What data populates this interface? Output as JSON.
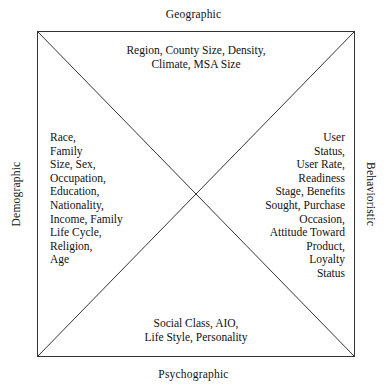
{
  "diagram": {
    "type": "four-quadrant-square-with-diagonals",
    "colors": {
      "background": "#ffffff",
      "line": "#333333",
      "text": "#111111"
    },
    "axes": {
      "top_label": "Geographic",
      "bottom_label": "Psychographic",
      "left_label": "Demographic",
      "right_label": "Behavioristic"
    },
    "quadrants": {
      "top": {
        "label": "Geographic",
        "items_text": "Region, County Size, Density,\nClimate, MSA Size",
        "items": [
          "Region",
          "County Size",
          "Density",
          "Climate",
          "MSA Size"
        ]
      },
      "left": {
        "label": "Demographic",
        "items_text": "Race,\nFamily\nSize, Sex,\nOccupation,\nEducation,\nNationality,\nIncome, Family\nLife Cycle,\nReligion,\nAge",
        "items": [
          "Race",
          "Family Size",
          "Sex",
          "Occupation",
          "Education",
          "Nationality",
          "Income",
          "Family Life Cycle",
          "Religion",
          "Age"
        ]
      },
      "right": {
        "label": "Behavioristic",
        "items_text": "User\nStatus,\nUser Rate,\nReadiness\nStage, Benefits\nSought, Purchase\nOccasion,\nAttitude Toward\nProduct,\nLoyalty\nStatus",
        "items": [
          "User Status",
          "User Rate",
          "Readiness Stage",
          "Benefits Sought",
          "Purchase Occasion",
          "Attitude Toward Product",
          "Loyalty Status"
        ]
      },
      "bottom": {
        "label": "Psychographic",
        "items_text": "Social Class, AIO,\nLife Style, Personality",
        "items": [
          "Social Class",
          "AIO",
          "Life Style",
          "Personality"
        ]
      }
    }
  }
}
